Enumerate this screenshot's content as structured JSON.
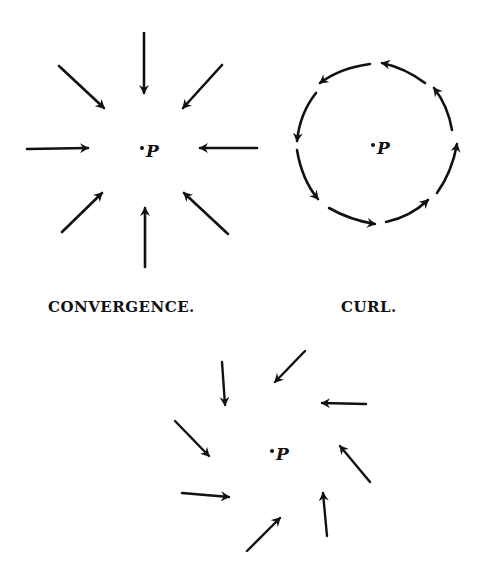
{
  "figure": {
    "ink_color": "#111111",
    "background": "#ffffff",
    "panels": [
      {
        "id": "convergence",
        "caption": "CONVERGENCE.",
        "center_label": "P",
        "arrow_count": 8,
        "arrow_direction": "inward toward P"
      },
      {
        "id": "curl",
        "caption": "CURL.",
        "center_label": "P",
        "arrow_count": 8,
        "arrow_direction": "circulating around P (counter-clockwise)"
      },
      {
        "id": "combined",
        "caption": "",
        "center_label": "P",
        "arrow_count": 8,
        "arrow_direction": "spiralling inward toward P"
      }
    ]
  }
}
